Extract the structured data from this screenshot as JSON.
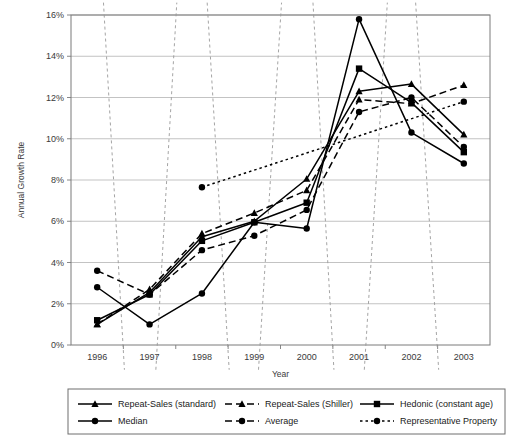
{
  "chart_data": {
    "type": "line",
    "title": "",
    "xlabel": "Year",
    "ylabel": "Annual Growth Rate",
    "categories": [
      "1996",
      "1997",
      "1998",
      "1999",
      "2000",
      "2001",
      "2002",
      "2003"
    ],
    "ylim": [
      0,
      16
    ],
    "ytick_values": [
      0,
      2,
      4,
      6,
      8,
      10,
      12,
      14,
      16
    ],
    "ytick_labels": [
      "0%",
      "2%",
      "4%",
      "6%",
      "8%",
      "10%",
      "12%",
      "14%",
      "16%"
    ],
    "grid": "horizontal",
    "legend_position": "bottom",
    "series": [
      {
        "name": "Repeat-Sales (standard)",
        "marker": "triangle",
        "line_style": "solid",
        "values": [
          1.0,
          2.55,
          5.25,
          6.0,
          8.05,
          12.3,
          12.65,
          10.2
        ]
      },
      {
        "name": "Repeat-Sales (Shiller)",
        "marker": "triangle",
        "line_style": "dashed",
        "values": [
          1.0,
          2.7,
          5.4,
          6.4,
          7.5,
          11.9,
          11.7,
          12.6
        ]
      },
      {
        "name": "Hedonic (constant age)",
        "marker": "square",
        "line_style": "solid",
        "values": [
          1.2,
          2.45,
          5.05,
          5.95,
          6.9,
          13.4,
          11.75,
          9.35
        ]
      },
      {
        "name": "Median",
        "marker": "circle",
        "line_style": "solid",
        "values": [
          2.8,
          1.0,
          2.5,
          5.95,
          5.65,
          15.8,
          10.3,
          8.8
        ]
      },
      {
        "name": "Average",
        "marker": "circle",
        "line_style": "dashed",
        "values": [
          3.6,
          2.45,
          4.6,
          5.3,
          6.55,
          11.3,
          12.0,
          9.6
        ]
      },
      {
        "name": "Representative Property",
        "marker": "circle",
        "line_style": "dotted",
        "values": [
          null,
          null,
          7.65,
          null,
          null,
          null,
          null,
          11.8
        ]
      }
    ],
    "legend_entries": [
      "Repeat-Sales (standard)",
      "Repeat-Sales (Shiller)",
      "Hedonic (constant age)",
      "Median",
      "Average",
      "Representative Property"
    ]
  },
  "colors": {
    "line": "#000000",
    "grid": "#b4b4b4",
    "axis": "#7a7a7a",
    "text": "#2a2a2a",
    "dotted_guide": "#9a9a9a"
  }
}
